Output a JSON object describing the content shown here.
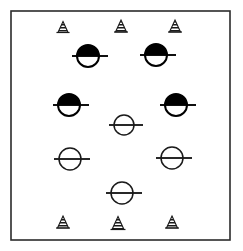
{
  "figure": {
    "title": "",
    "background_color": "#ffffff",
    "ink_color": "#1a1a1a",
    "width": 243,
    "height": 251
  },
  "frame": {
    "name": "plot-border",
    "x": 11,
    "y": 11,
    "width": 219,
    "height": 229,
    "stroke": "#2b2b2b",
    "stroke_width": 1.6,
    "fill": "none"
  },
  "legend_semantics": {
    "triangle": "hatched-triangle-marker",
    "half_filled_circle": "half-filled-circle-with-bar-marker",
    "open_circle": "open-circle-with-bar-marker"
  },
  "chart_data": {
    "type": "scatter",
    "title": "",
    "xlabel": "",
    "ylabel": "",
    "xlim": [
      11,
      230
    ],
    "ylim": [
      11,
      240
    ],
    "grid": false,
    "legend_position": "none",
    "axis_ticks": [],
    "series": [
      {
        "name": "hatched-triangle",
        "marker": "triangle",
        "fill": "hatched",
        "color": "#1a1a1a",
        "points": [
          {
            "x": 63,
            "y": 27,
            "size": 11
          },
          {
            "x": 121,
            "y": 26,
            "size": 12
          },
          {
            "x": 175,
            "y": 26,
            "size": 12
          },
          {
            "x": 63,
            "y": 222,
            "size": 12
          },
          {
            "x": 118,
            "y": 223,
            "size": 13
          },
          {
            "x": 172,
            "y": 222,
            "size": 12
          }
        ]
      },
      {
        "name": "half-filled-circle",
        "marker": "circle-with-bar",
        "fill": "top-half-black",
        "color": "#000000",
        "points": [
          {
            "x": 88,
            "y": 56,
            "r": 11
          },
          {
            "x": 156,
            "y": 55,
            "r": 11
          },
          {
            "x": 69,
            "y": 105,
            "r": 11
          },
          {
            "x": 176,
            "y": 105,
            "r": 11
          }
        ]
      },
      {
        "name": "open-circle",
        "marker": "circle-with-bar",
        "fill": "none",
        "color": "#1a1a1a",
        "points": [
          {
            "x": 124,
            "y": 125,
            "r": 10
          },
          {
            "x": 70,
            "y": 159,
            "r": 11
          },
          {
            "x": 172,
            "y": 158,
            "r": 11
          },
          {
            "x": 122,
            "y": 193,
            "r": 11
          }
        ]
      }
    ]
  }
}
